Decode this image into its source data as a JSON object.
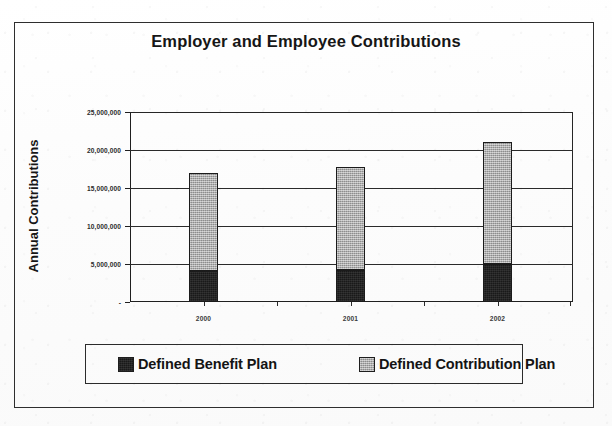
{
  "chart_data": {
    "type": "bar",
    "subtype": "stacked-column",
    "title": "Employer and Employee Contributions",
    "subtitle": "",
    "xlabel": "",
    "ylabel": "Annual Contributions",
    "categories": [
      "2000",
      "2001",
      "2002"
    ],
    "series": [
      {
        "name": "Defined Benefit Plan",
        "color": "#191919",
        "values": [
          4100000,
          4200000,
          5000000
        ]
      },
      {
        "name": "Defined Contribution Plan",
        "color": "#a9a9a9",
        "values": [
          12900000,
          13600000,
          16000000
        ]
      }
    ],
    "totals": [
      17000000,
      17800000,
      21000000
    ],
    "ylim": [
      0,
      25000000
    ],
    "ytick_values": [
      0,
      5000000,
      10000000,
      15000000,
      20000000,
      25000000
    ],
    "ytick_labels": [
      "-",
      "5,000,000",
      "10,000,000",
      "15,000,000",
      "20,000,000",
      "25,000,000"
    ],
    "grid": true,
    "grid_axis": "y",
    "legend_position": "bottom",
    "legend_entries": [
      "Defined Benefit Plan",
      "Defined Contribution Plan"
    ],
    "plot_background": "#ffffff",
    "frame_color": "#2e2e2e"
  },
  "title": {
    "text": "Employer and Employee Contributions"
  },
  "axes": {
    "y_title": "Annual Contributions",
    "y_ticks": [
      {
        "label": "25,000,000",
        "value": 25000000
      },
      {
        "label": "20,000,000",
        "value": 20000000
      },
      {
        "label": "15,000,000",
        "value": 15000000
      },
      {
        "label": "10,000,000",
        "value": 10000000
      },
      {
        "label": "5,000,000",
        "value": 5000000
      },
      {
        "label": "-",
        "value": 0
      }
    ],
    "x_ticks": [
      {
        "label": "2000"
      },
      {
        "label": "2001"
      },
      {
        "label": "2002"
      }
    ]
  },
  "legend": {
    "items": [
      {
        "label": "Defined Benefit Plan",
        "swatch": "#191919"
      },
      {
        "label": "Defined Contribution Plan",
        "swatch": "#a9a9a9"
      }
    ]
  }
}
